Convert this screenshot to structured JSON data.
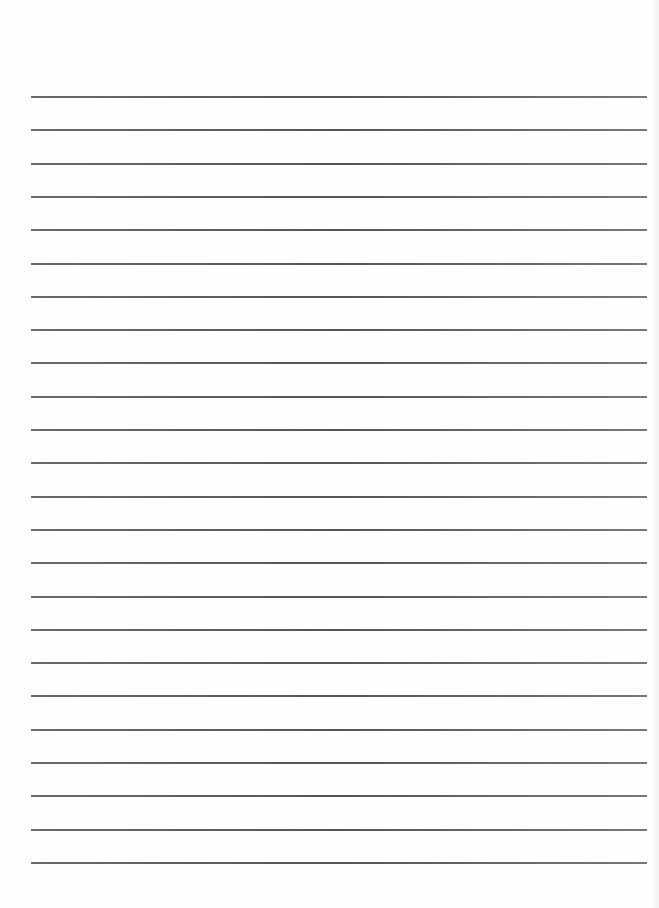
{
  "page": {
    "type": "lined-paper",
    "background": "#fefefe",
    "line_color": "#5a5a5a",
    "line_count": 24,
    "first_line_y": 96,
    "line_spacing": 33.3,
    "line_left": 31,
    "line_right": 647
  }
}
